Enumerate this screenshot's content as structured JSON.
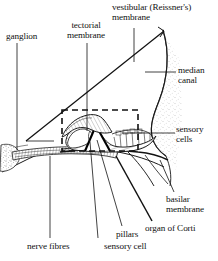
{
  "figure": {
    "background_color": "#ffffff",
    "ink_color": "#111111",
    "width": 218,
    "height": 261
  },
  "labels": {
    "ganglion": "ganglion",
    "tectorial_membrane": "tectorial\nmembrane",
    "vestibular_membrane": "vestibular (Reissner's)\nmembrane",
    "median_canal": "median\ncanal",
    "sensory_cells": "sensory\ncells",
    "basilar_membrane": "basilar\nmembrane",
    "organ_of_corti": "organ of Corti",
    "nerve_fibres": "nerve fibres",
    "sensory_cell": "sensory cell",
    "pillars": "pillars"
  },
  "structures": [
    {
      "name": "vestibular-reissners-membrane",
      "kind": "line"
    },
    {
      "name": "median-canal",
      "kind": "region"
    },
    {
      "name": "tectorial-membrane",
      "kind": "region"
    },
    {
      "name": "basilar-membrane",
      "kind": "line"
    },
    {
      "name": "organ-of-corti",
      "kind": "region"
    },
    {
      "name": "spiral-ganglion",
      "kind": "region"
    },
    {
      "name": "nerve-fibres",
      "kind": "bundle"
    },
    {
      "name": "pillar-cells",
      "kind": "pair"
    },
    {
      "name": "sensory-hair-cells",
      "kind": "cells"
    },
    {
      "name": "detail-box",
      "kind": "dashed-rectangle"
    }
  ]
}
